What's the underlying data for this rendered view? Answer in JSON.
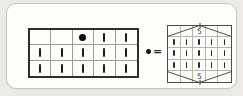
{
  "left_grid": {
    "columns": 5,
    "rows": 3,
    "cells": [
      [
        "empty",
        "empty",
        "dot",
        "tick",
        "tick"
      ],
      [
        "tick",
        "tick",
        "tick",
        "tick",
        "tick"
      ],
      [
        "tick",
        "tick",
        "tick",
        "tick",
        "tick"
      ]
    ]
  },
  "equivalence": {
    "dot_symbol": "●",
    "equals_sign": "="
  },
  "right_grid": {
    "columns": 5,
    "rows": 5,
    "shape": "hexagon",
    "top_label": "5",
    "bottom_label": "5",
    "cells": [
      [
        "empty",
        "empty",
        "empty",
        "empty",
        "empty"
      ],
      [
        "tick",
        "tick",
        "tick",
        "tick",
        "tick"
      ],
      [
        "tick",
        "tick",
        "tick",
        "tick",
        "tick"
      ],
      [
        "tick",
        "tick",
        "tick",
        "tick",
        "tick"
      ],
      [
        "empty",
        "empty",
        "empty",
        "empty",
        "empty"
      ]
    ]
  },
  "colors": {
    "page_background": "#ebeae7",
    "card_background": "#fdfdfc",
    "card_border": "#c9c9c5",
    "left_grid_border": "#2e2e2c",
    "inner_gridline": "#9b9b97",
    "right_grid_border": "#4c4c49",
    "right_inner_gridline": "#b5b5b1",
    "mark_color": "#1d1d1b",
    "hexagon_line": "#4f4f4c"
  }
}
